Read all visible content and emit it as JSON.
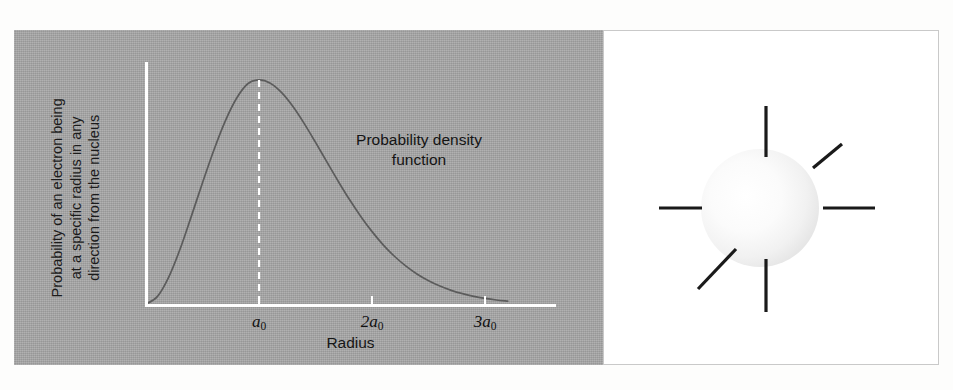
{
  "figure": {
    "left_panel_background": "#a6a6a6",
    "right_panel_background": "#ffffff"
  },
  "chart_data": {
    "type": "line",
    "title": "",
    "xlabel": "Radius",
    "ylabel": "Probability of an electron being\nat a specific radius in any\ndirection from the nucleus",
    "annotation": "Probability density\nfunction",
    "xtick_labels": [
      "a_0",
      "2a_0",
      "3a_0"
    ],
    "xticks_html": [
      "a<sub>0</sub>",
      "2a<sub>0</sub>",
      "3a<sub>0</sub>"
    ],
    "xlim": [
      0,
      3.45
    ],
    "ylim": [
      0,
      1.08
    ],
    "grid": false,
    "legend": false,
    "curve_color": "#5c5c5c",
    "axis_color": "#ffffff",
    "peak_marker": {
      "x_label": "a_0",
      "x": 1.0,
      "y": 1.0,
      "style": "dashed",
      "color": "#ffffff"
    },
    "series": [
      {
        "name": "Radial probability distribution (1s)",
        "x": [
          0.0,
          0.1,
          0.2,
          0.3,
          0.4,
          0.5,
          0.6,
          0.7,
          0.8,
          0.9,
          1.0,
          1.1,
          1.2,
          1.3,
          1.4,
          1.5,
          1.6,
          1.7,
          1.8,
          1.9,
          2.0,
          2.1,
          2.2,
          2.3,
          2.4,
          2.5,
          2.6,
          2.7,
          2.8,
          2.9,
          3.0,
          3.1,
          3.2
        ],
        "y": [
          0.0,
          0.033,
          0.119,
          0.243,
          0.39,
          0.541,
          0.686,
          0.815,
          0.917,
          0.983,
          1.0,
          0.985,
          0.943,
          0.881,
          0.805,
          0.721,
          0.634,
          0.548,
          0.466,
          0.391,
          0.323,
          0.263,
          0.212,
          0.169,
          0.133,
          0.104,
          0.08,
          0.061,
          0.046,
          0.034,
          0.025,
          0.018,
          0.013
        ]
      }
    ]
  },
  "orbital_diagram": {
    "sphere": {
      "label": "electron-cloud-sphere",
      "center_x": 156,
      "center_y": 177,
      "radius": 59,
      "highlight_color": "#ffffff",
      "edge_color": "#e2e2e2"
    },
    "rays": [
      {
        "name": "ray-up",
        "x1": 162,
        "y1": 75,
        "x2": 162,
        "y2": 126
      },
      {
        "name": "ray-down",
        "x1": 162,
        "y1": 228,
        "x2": 162,
        "y2": 281
      },
      {
        "name": "ray-left",
        "x1": 55,
        "y1": 177,
        "x2": 98,
        "y2": 177
      },
      {
        "name": "ray-right",
        "x1": 219,
        "y1": 177,
        "x2": 271,
        "y2": 177
      },
      {
        "name": "ray-upper-right",
        "x1": 209,
        "y1": 137,
        "x2": 238,
        "y2": 113
      },
      {
        "name": "ray-lower-left",
        "x1": 132,
        "y1": 218,
        "x2": 94,
        "y2": 258
      }
    ],
    "ray_color": "#1a1a1a"
  }
}
